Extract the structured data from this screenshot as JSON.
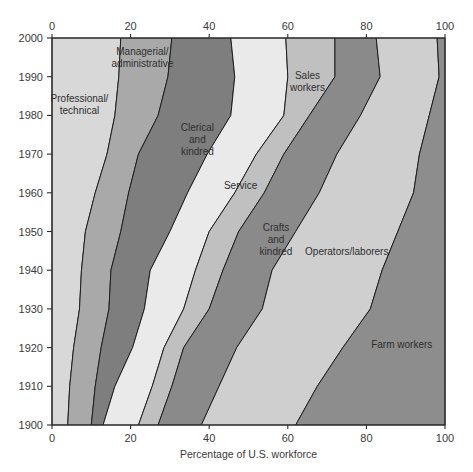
{
  "chart_data": {
    "type": "area",
    "title": "",
    "subtitle": "",
    "xlabel": "Percentage of U.S. workforce",
    "ylabel": "",
    "xlim": [
      0,
      100
    ],
    "ylim": [
      1900,
      2000
    ],
    "grid": false,
    "legend_position": "inline-labels",
    "orientation": "horizontal-stacked-by-year",
    "x_ticks": [
      "0",
      "20",
      "40",
      "60",
      "80",
      "100"
    ],
    "x_tick_values": [
      0,
      20,
      40,
      60,
      80,
      100
    ],
    "y_ticks": [
      "1900",
      "1910",
      "1920",
      "1930",
      "1940",
      "1950",
      "1960",
      "1970",
      "1980",
      "1990",
      "2000"
    ],
    "y_tick_values": [
      1900,
      1910,
      1920,
      1930,
      1940,
      1950,
      1960,
      1970,
      1980,
      1990,
      2000
    ],
    "years": [
      1900,
      1910,
      1920,
      1930,
      1940,
      1950,
      1960,
      1970,
      1980,
      1990,
      2000
    ],
    "series": [
      {
        "name": "Professional/technical",
        "color": "#d8d8d8",
        "values": [
          4.0,
          4.5,
          5.5,
          7.0,
          7.5,
          8.5,
          11.0,
          14.0,
          16.0,
          17.0,
          17.5
        ]
      },
      {
        "name": "Managerial/administrative",
        "color": "#a9a9a9",
        "values": [
          6.0,
          6.5,
          7.0,
          7.5,
          7.5,
          9.0,
          8.5,
          8.0,
          11.0,
          12.5,
          13.0
        ]
      },
      {
        "name": "Clerical and kindred",
        "color": "#7e7e7e",
        "values": [
          3.0,
          5.0,
          8.0,
          9.0,
          10.0,
          12.5,
          15.0,
          17.5,
          18.5,
          17.0,
          15.0
        ]
      },
      {
        "name": "Service",
        "color": "#eaeaea",
        "values": [
          9.0,
          9.5,
          8.0,
          10.0,
          11.5,
          10.0,
          12.0,
          12.5,
          13.5,
          13.5,
          14.0
        ]
      },
      {
        "name": "Sales workers",
        "color": "#c0c0c0",
        "values": [
          5.0,
          5.0,
          5.0,
          6.5,
          7.0,
          7.5,
          7.5,
          7.0,
          6.5,
          12.0,
          12.5
        ]
      },
      {
        "name": "Crafts and kindred",
        "color": "#8a8a8a",
        "values": [
          11.0,
          12.0,
          13.5,
          13.5,
          12.5,
          14.5,
          14.0,
          13.5,
          13.0,
          11.5,
          10.5
        ]
      },
      {
        "name": "Operators/laborers",
        "color": "#cfcfcf",
        "values": [
          24.0,
          25.0,
          27.0,
          27.5,
          28.0,
          26.0,
          24.0,
          21.0,
          17.5,
          15.0,
          15.5
        ]
      },
      {
        "name": "Farm workers",
        "color": "#8d8d8d",
        "values": [
          38.0,
          32.5,
          26.0,
          19.0,
          16.0,
          12.0,
          8.0,
          6.5,
          4.0,
          1.5,
          2.0
        ]
      }
    ],
    "band_labels": [
      {
        "text_lines": [
          "Professional/",
          "technical"
        ],
        "x_pct": 7,
        "year": 1983
      },
      {
        "text_lines": [
          "Managerial/",
          "administrative"
        ],
        "x_pct": 23,
        "year": 1995
      },
      {
        "text_lines": [
          "Clerical",
          "and",
          "kindred"
        ],
        "x_pct": 37,
        "year": 1974
      },
      {
        "text_lines": [
          "Service"
        ],
        "x_pct": 48,
        "year": 1962
      },
      {
        "text_lines": [
          "Sales",
          "workers"
        ],
        "x_pct": 65,
        "year": 1989
      },
      {
        "text_lines": [
          "Crafts",
          "and",
          "kindred"
        ],
        "x_pct": 57,
        "year": 1948
      },
      {
        "text_lines": [
          "Operators/laborers"
        ],
        "x_pct": 75,
        "year": 1945
      },
      {
        "text_lines": [
          "Farm workers"
        ],
        "x_pct": 89,
        "year": 1921
      }
    ]
  }
}
